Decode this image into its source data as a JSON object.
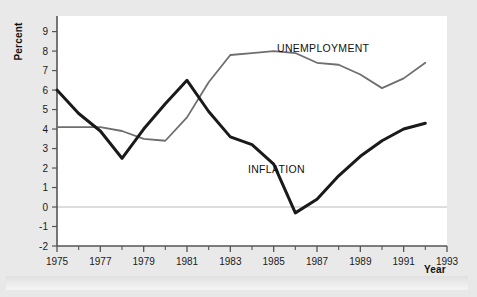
{
  "figure": {
    "background_color": "#e9e9e9",
    "plot_background_color": "#ffffff",
    "axis_color": "#555555",
    "zero_line_color": "#bbbbbb"
  },
  "axes": {
    "y_title": "Percent",
    "x_title": "Year"
  },
  "chart_data": {
    "type": "line",
    "title": "",
    "xlabel": "Year",
    "ylabel": "Percent",
    "xlim": [
      1975,
      1993
    ],
    "ylim": [
      -2,
      9.8
    ],
    "grid": false,
    "legend": "inline-annotations",
    "x_tick_labels": [
      "1975",
      "1977",
      "1979",
      "1981",
      "1983",
      "1985",
      "1987",
      "1989",
      "1991",
      "1993"
    ],
    "x_tick_values": [
      1975,
      1977,
      1979,
      1981,
      1983,
      1985,
      1987,
      1989,
      1991,
      1993
    ],
    "x_minor_tick_values": [
      1976,
      1978,
      1980,
      1982,
      1984,
      1986,
      1988,
      1990,
      1992
    ],
    "y_tick_labels": [
      "9",
      "8",
      "7",
      "6",
      "5",
      "4",
      "3",
      "2",
      "1",
      "0",
      "-1",
      "-2"
    ],
    "y_tick_values": [
      9,
      8,
      7,
      6,
      5,
      4,
      3,
      2,
      1,
      0,
      -1,
      -2
    ],
    "zero_reference_line": 0,
    "x": [
      1975,
      1976,
      1977,
      1978,
      1979,
      1980,
      1981,
      1982,
      1983,
      1984,
      1985,
      1986,
      1987,
      1988,
      1989,
      1990,
      1991,
      1992
    ],
    "series": [
      {
        "name": "UNEMPLOYMENT",
        "color": "#6e6e6e",
        "line_width": 1.8,
        "label_position": "upper-center",
        "values": [
          4.1,
          4.1,
          4.1,
          3.9,
          3.5,
          3.4,
          4.6,
          6.4,
          7.8,
          7.9,
          8.0,
          7.9,
          7.4,
          7.3,
          6.8,
          6.1,
          6.6,
          7.4
        ]
      },
      {
        "name": "INFLATION",
        "color": "#1a1a1a",
        "line_width": 3.0,
        "label_position": "mid-center",
        "values": [
          6.0,
          4.8,
          3.9,
          2.5,
          4.0,
          5.3,
          6.5,
          4.9,
          3.6,
          3.2,
          2.2,
          -0.3,
          0.4,
          1.6,
          2.6,
          3.4,
          4.0,
          4.3
        ]
      }
    ]
  }
}
